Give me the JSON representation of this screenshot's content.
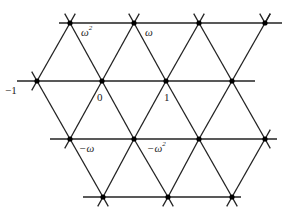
{
  "diagram": {
    "line_color": "#222222",
    "point_color": "#000000",
    "labels": [
      {
        "id": "omega-squared",
        "base": "ω",
        "sup": "2",
        "x": 81,
        "y": 27
      },
      {
        "id": "omega",
        "base": "ω",
        "sup": "",
        "x": 145,
        "y": 27
      },
      {
        "id": "minus-one",
        "base": "−1",
        "sup": "",
        "x": 5,
        "y": 85
      },
      {
        "id": "zero",
        "base": "0",
        "sup": "",
        "x": 97,
        "y": 92
      },
      {
        "id": "one",
        "base": "1",
        "sup": "",
        "x": 164,
        "y": 92
      },
      {
        "id": "minus-omega",
        "base": "−ω",
        "sup": "",
        "x": 79,
        "y": 143
      },
      {
        "id": "minus-omega-squared",
        "base": "−ω",
        "sup": "2",
        "x": 147,
        "y": 143
      }
    ],
    "rows": [
      {
        "y": 23,
        "x_start": 59,
        "x_end": 282,
        "points": [
          70,
          134,
          199,
          265
        ]
      },
      {
        "y": 81,
        "x_start": 17,
        "x_end": 255,
        "points": [
          37,
          102,
          166,
          232
        ]
      },
      {
        "y": 139,
        "x_start": 50,
        "x_end": 277,
        "points": [
          70,
          134,
          199,
          265
        ]
      },
      {
        "y": 197,
        "x_start": 83,
        "x_end": 241,
        "points": [
          103,
          168,
          232
        ]
      }
    ]
  }
}
